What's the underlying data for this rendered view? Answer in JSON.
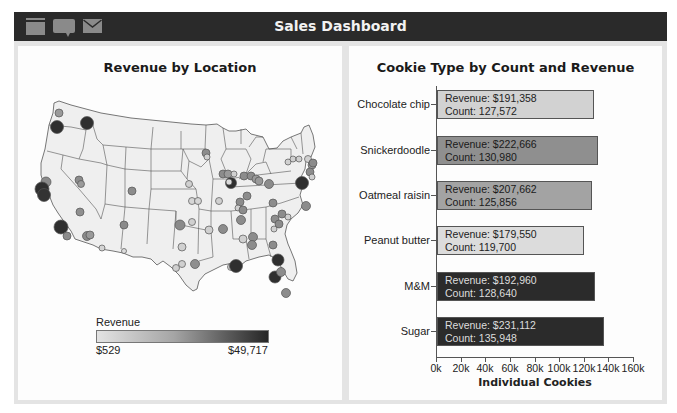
{
  "header": {
    "title": "Sales Dashboard",
    "icons": [
      "window-icon",
      "chat-bubble-icon",
      "mail-icon"
    ]
  },
  "colors": {
    "titlebar": "#2a2a2a",
    "icon": "#8a8a8a",
    "frame": "#e4e4e4",
    "panel": "#fdfdfd",
    "map_fill": "#efefef",
    "map_stroke": "#555555"
  },
  "left_panel": {
    "title": "Revenue by Location",
    "legend": {
      "title": "Revenue",
      "min_label": "$529",
      "max_label": "$49,717"
    }
  },
  "right_panel": {
    "title": "Cookie Type by Count and Revenue"
  },
  "chart_data": [
    {
      "type": "bar",
      "orientation": "horizontal",
      "title": "Cookie Type by Count and Revenue",
      "xlabel": "Individual Cookies",
      "ylabel": "",
      "xlim": [
        0,
        160000
      ],
      "x_ticks": [
        "0k",
        "20k",
        "40k",
        "60k",
        "80k",
        "100k",
        "120k",
        "140k",
        "160k"
      ],
      "grid": false,
      "legend": "none (bar shade encodes revenue, darker = higher)",
      "categories": [
        "Chocolate chip",
        "Snickerdoodle",
        "Oatmeal raisin",
        "Peanut butter",
        "M&M",
        "Sugar"
      ],
      "series": [
        {
          "name": "Count",
          "values": [
            127572,
            130980,
            125856,
            119700,
            128640,
            135948
          ]
        },
        {
          "name": "Revenue",
          "values": [
            191358,
            222666,
            207662,
            179550,
            192960,
            231112
          ]
        }
      ],
      "bars": [
        {
          "label": "Chocolate chip",
          "revenue_text": "Revenue: $191,358",
          "count_text": "Count: 127,572",
          "count": 127572,
          "fill": "#d2d2d2",
          "text_color": "#222222"
        },
        {
          "label": "Snickerdoodle",
          "revenue_text": "Revenue: $222,666",
          "count_text": "Count: 130,980",
          "count": 130980,
          "fill": "#8f8f8f",
          "text_color": "#1a1a1a"
        },
        {
          "label": "Oatmeal raisin",
          "revenue_text": "Revenue: $207,662",
          "count_text": "Count: 125,856",
          "count": 125856,
          "fill": "#a3a3a3",
          "text_color": "#1a1a1a"
        },
        {
          "label": "Peanut butter",
          "revenue_text": "Revenue: $179,550",
          "count_text": "Count: 119,700",
          "count": 119700,
          "fill": "#dcdcdc",
          "text_color": "#222222"
        },
        {
          "label": "M&M",
          "revenue_text": "Revenue: $192,960",
          "count_text": "Count: 128,640",
          "count": 128640,
          "fill": "#2b2b2b",
          "text_color": "#dddddd"
        },
        {
          "label": "Sugar",
          "revenue_text": "Revenue: $231,112",
          "count_text": "Count: 135,948",
          "count": 135948,
          "fill": "#2b2b2b",
          "text_color": "#dddddd"
        }
      ]
    },
    {
      "type": "scatter",
      "subtype": "bubble map",
      "title": "Revenue by Location",
      "region": "Contiguous United States",
      "color_scale": {
        "title": "Revenue",
        "min": 529,
        "max": 49717,
        "min_label": "$529",
        "max_label": "$49,717",
        "low_color": "#e3e3e3",
        "high_color": "#262626"
      },
      "points_approx": [
        {
          "place": "Seattle WA",
          "size": "small",
          "level": "mid"
        },
        {
          "place": "Portland OR",
          "size": "large",
          "level": "high"
        },
        {
          "place": "Spokane WA",
          "size": "large",
          "level": "high"
        },
        {
          "place": "San Francisco Bay Area CA",
          "size": "large",
          "level": "high"
        },
        {
          "place": "Los Angeles CA",
          "size": "large",
          "level": "high"
        },
        {
          "place": "Chicago IL",
          "size": "large",
          "level": "high"
        },
        {
          "place": "New York NY",
          "size": "large",
          "level": "high"
        },
        {
          "place": "New Orleans LA",
          "size": "large",
          "level": "high"
        },
        {
          "place": "Jacksonville FL",
          "size": "large",
          "level": "high"
        },
        {
          "place": "Tampa FL",
          "size": "large",
          "level": "high"
        },
        {
          "place": "Salt Lake City UT",
          "size": "medium",
          "level": "mid"
        },
        {
          "place": "Denver CO",
          "size": "medium",
          "level": "mid"
        },
        {
          "place": "Phoenix AZ",
          "size": "medium",
          "level": "mid"
        },
        {
          "place": "Albuquerque NM",
          "size": "medium",
          "level": "mid"
        },
        {
          "place": "Oklahoma City OK",
          "size": "medium",
          "level": "mid"
        },
        {
          "place": "Houston TX",
          "size": "medium",
          "level": "mid"
        },
        {
          "place": "Atlanta GA",
          "size": "medium",
          "level": "mid"
        },
        {
          "place": "Nashville TN",
          "size": "medium",
          "level": "mid"
        },
        {
          "place": "Boston MA",
          "size": "medium",
          "level": "mid"
        },
        {
          "place": "Miami FL",
          "size": "medium",
          "level": "mid"
        },
        {
          "place": "Tucson AZ",
          "size": "small",
          "level": "low"
        },
        {
          "place": "El Paso TX",
          "size": "small",
          "level": "low"
        },
        {
          "place": "Omaha NE",
          "size": "small",
          "level": "low"
        },
        {
          "place": "Kansas City MO",
          "size": "small",
          "level": "low"
        },
        {
          "place": "Dallas TX",
          "size": "small",
          "level": "low"
        },
        {
          "place": "Little Rock AR",
          "size": "small",
          "level": "low"
        }
      ]
    }
  ]
}
